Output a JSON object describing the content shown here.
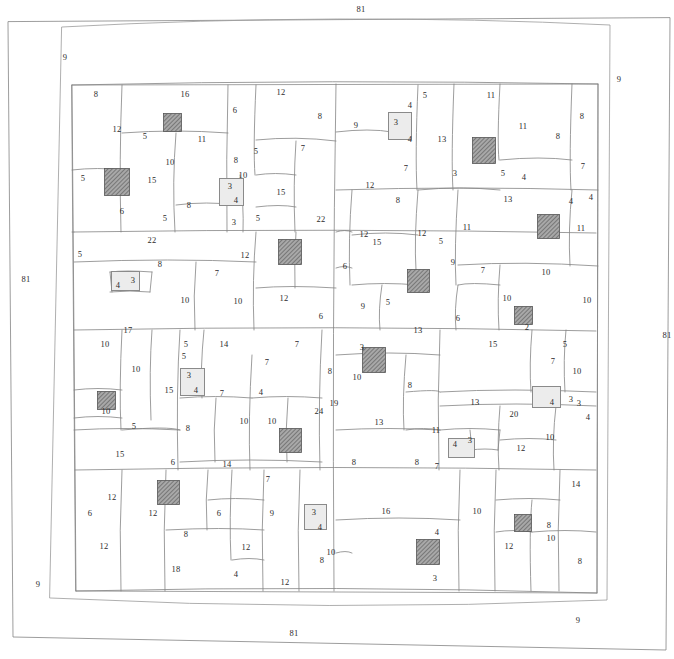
{
  "diagram": {
    "kind": "hand-drawn rectangular building plan with perimeter corridor and partitioned room grid",
    "stroke_color": "#777777",
    "text_color": "#2b2b2b",
    "background_color": "#ffffff",
    "hatch_fill_color": "#9a9a9a",
    "light_fill_color": "#ececec"
  },
  "perimeter": {
    "top_length": "81",
    "bottom_length": "81",
    "left_length": "81",
    "right_length": "81",
    "corner_top_left": "9",
    "corner_top_right": "9",
    "corner_bottom_left": "9",
    "corner_bottom_right": "9"
  },
  "shafts": [
    {
      "id": "shaft-1",
      "style": "hatch",
      "w": "3",
      "h": "3",
      "x": 117,
      "y": 182,
      "bw": 26,
      "bh": 28
    },
    {
      "id": "shaft-2",
      "style": "hatch",
      "w": "2",
      "h": "2",
      "x": 172,
      "y": 122,
      "bw": 19,
      "bh": 19
    },
    {
      "id": "shaft-3",
      "style": "hatch",
      "w": "3",
      "h": "3",
      "x": 290,
      "y": 252,
      "bw": 24,
      "bh": 26
    },
    {
      "id": "shaft-4",
      "style": "hatch",
      "w": "3",
      "h": "3",
      "x": 484,
      "y": 150,
      "bw": 24,
      "bh": 27
    },
    {
      "id": "shaft-5",
      "style": "hatch",
      "w": "3",
      "h": "3",
      "x": 548,
      "y": 226,
      "bw": 23,
      "bh": 25
    },
    {
      "id": "shaft-6",
      "style": "hatch",
      "w": "3",
      "h": "3",
      "x": 418,
      "y": 281,
      "bw": 23,
      "bh": 24
    },
    {
      "id": "shaft-7",
      "style": "hatch",
      "w": "2",
      "h": "2",
      "x": 523,
      "y": 315,
      "bw": 19,
      "bh": 19
    },
    {
      "id": "shaft-8",
      "style": "hatch",
      "w": "3",
      "h": "3",
      "x": 374,
      "y": 360,
      "bw": 24,
      "bh": 26
    },
    {
      "id": "shaft-9",
      "style": "hatch",
      "w": "2",
      "h": "2",
      "x": 106,
      "y": 400,
      "bw": 19,
      "bh": 19
    },
    {
      "id": "shaft-10",
      "style": "hatch",
      "w": "3",
      "h": "3",
      "x": 290,
      "y": 440,
      "bw": 23,
      "bh": 25
    },
    {
      "id": "shaft-11",
      "style": "hatch",
      "w": "3",
      "h": "3",
      "x": 168,
      "y": 492,
      "bw": 23,
      "bh": 25
    },
    {
      "id": "shaft-12",
      "style": "hatch",
      "w": "3",
      "h": "3",
      "x": 428,
      "y": 552,
      "bw": 24,
      "bh": 26
    },
    {
      "id": "shaft-13",
      "style": "hatch",
      "w": "2",
      "h": "2",
      "x": 523,
      "y": 523,
      "bw": 18,
      "bh": 18
    },
    {
      "id": "shaft-14",
      "style": "light",
      "w": "3",
      "h": "4",
      "x": 231,
      "y": 192,
      "bw": 25,
      "bh": 28
    },
    {
      "id": "shaft-15",
      "style": "light",
      "w": "3",
      "h": "4",
      "x": 400,
      "y": 126,
      "bw": 24,
      "bh": 28
    },
    {
      "id": "shaft-16",
      "style": "light",
      "w": "4",
      "h": "3",
      "x": 125,
      "y": 281,
      "bw": 29,
      "bh": 20
    },
    {
      "id": "shaft-17",
      "style": "light",
      "w": "3",
      "h": "4",
      "x": 192,
      "y": 382,
      "bw": 25,
      "bh": 28
    },
    {
      "id": "shaft-18",
      "style": "light",
      "w": "4",
      "h": "3",
      "x": 546,
      "y": 397,
      "bw": 29,
      "bh": 22
    },
    {
      "id": "shaft-19",
      "style": "light",
      "w": "4",
      "h": "3",
      "x": 461,
      "y": 448,
      "bw": 27,
      "bh": 20
    },
    {
      "id": "shaft-20",
      "style": "light",
      "w": "3",
      "h": "",
      "x": 315,
      "y": 517,
      "bw": 23,
      "bh": 26
    }
  ],
  "dimensions": [
    {
      "v": "81",
      "x": 361,
      "y": 9
    },
    {
      "v": "9",
      "x": 65,
      "y": 57
    },
    {
      "v": "9",
      "x": 619,
      "y": 79
    },
    {
      "v": "81",
      "x": 26,
      "y": 279
    },
    {
      "v": "81",
      "x": 667,
      "y": 335
    },
    {
      "v": "9",
      "x": 38,
      "y": 584
    },
    {
      "v": "9",
      "x": 578,
      "y": 620
    },
    {
      "v": "81",
      "x": 294,
      "y": 633
    },
    {
      "v": "8",
      "x": 96,
      "y": 94
    },
    {
      "v": "16",
      "x": 185,
      "y": 94
    },
    {
      "v": "12",
      "x": 281,
      "y": 92
    },
    {
      "v": "6",
      "x": 235,
      "y": 110
    },
    {
      "v": "8",
      "x": 320,
      "y": 116
    },
    {
      "v": "12",
      "x": 117,
      "y": 129
    },
    {
      "v": "5",
      "x": 145,
      "y": 136
    },
    {
      "v": "11",
      "x": 202,
      "y": 139
    },
    {
      "v": "9",
      "x": 356,
      "y": 125
    },
    {
      "v": "4",
      "x": 410,
      "y": 105
    },
    {
      "v": "3",
      "x": 396,
      "y": 122
    },
    {
      "v": "4",
      "x": 410,
      "y": 139
    },
    {
      "v": "5",
      "x": 425,
      "y": 95
    },
    {
      "v": "11",
      "x": 491,
      "y": 95
    },
    {
      "v": "13",
      "x": 442,
      "y": 139
    },
    {
      "v": "11",
      "x": 523,
      "y": 126
    },
    {
      "v": "8",
      "x": 558,
      "y": 136
    },
    {
      "v": "8",
      "x": 582,
      "y": 116
    },
    {
      "v": "7",
      "x": 406,
      "y": 168
    },
    {
      "v": "7",
      "x": 583,
      "y": 166
    },
    {
      "v": "3",
      "x": 455,
      "y": 173
    },
    {
      "v": "5",
      "x": 503,
      "y": 173
    },
    {
      "v": "4",
      "x": 524,
      "y": 177
    },
    {
      "v": "5",
      "x": 83,
      "y": 178
    },
    {
      "v": "10",
      "x": 170,
      "y": 162
    },
    {
      "v": "15",
      "x": 152,
      "y": 180
    },
    {
      "v": "8",
      "x": 236,
      "y": 160
    },
    {
      "v": "5",
      "x": 256,
      "y": 151
    },
    {
      "v": "7",
      "x": 303,
      "y": 148
    },
    {
      "v": "10",
      "x": 243,
      "y": 175
    },
    {
      "v": "3",
      "x": 230,
      "y": 186
    },
    {
      "v": "4",
      "x": 236,
      "y": 200
    },
    {
      "v": "15",
      "x": 281,
      "y": 192
    },
    {
      "v": "8",
      "x": 189,
      "y": 205
    },
    {
      "v": "6",
      "x": 122,
      "y": 211
    },
    {
      "v": "5",
      "x": 165,
      "y": 218
    },
    {
      "v": "3",
      "x": 234,
      "y": 222
    },
    {
      "v": "5",
      "x": 258,
      "y": 218
    },
    {
      "v": "22",
      "x": 321,
      "y": 219
    },
    {
      "v": "12",
      "x": 370,
      "y": 185
    },
    {
      "v": "8",
      "x": 398,
      "y": 200
    },
    {
      "v": "13",
      "x": 508,
      "y": 199
    },
    {
      "v": "4",
      "x": 571,
      "y": 201
    },
    {
      "v": "4",
      "x": 591,
      "y": 197
    },
    {
      "v": "12",
      "x": 364,
      "y": 234
    },
    {
      "v": "15",
      "x": 377,
      "y": 242
    },
    {
      "v": "12",
      "x": 422,
      "y": 233
    },
    {
      "v": "5",
      "x": 441,
      "y": 241
    },
    {
      "v": "11",
      "x": 467,
      "y": 227
    },
    {
      "v": "11",
      "x": 581,
      "y": 228
    },
    {
      "v": "22",
      "x": 152,
      "y": 240
    },
    {
      "v": "5",
      "x": 80,
      "y": 254
    },
    {
      "v": "8",
      "x": 160,
      "y": 264
    },
    {
      "v": "7",
      "x": 217,
      "y": 273
    },
    {
      "v": "12",
      "x": 245,
      "y": 255
    },
    {
      "v": "4",
      "x": 118,
      "y": 285
    },
    {
      "v": "3",
      "x": 133,
      "y": 280
    },
    {
      "v": "6",
      "x": 345,
      "y": 266
    },
    {
      "v": "9",
      "x": 453,
      "y": 262
    },
    {
      "v": "7",
      "x": 483,
      "y": 270
    },
    {
      "v": "10",
      "x": 546,
      "y": 272
    },
    {
      "v": "10",
      "x": 185,
      "y": 300
    },
    {
      "v": "10",
      "x": 238,
      "y": 301
    },
    {
      "v": "12",
      "x": 284,
      "y": 298
    },
    {
      "v": "5",
      "x": 388,
      "y": 302
    },
    {
      "v": "9",
      "x": 363,
      "y": 306
    },
    {
      "v": "6",
      "x": 321,
      "y": 316
    },
    {
      "v": "6",
      "x": 458,
      "y": 318
    },
    {
      "v": "10",
      "x": 507,
      "y": 298
    },
    {
      "v": "10",
      "x": 587,
      "y": 300
    },
    {
      "v": "2",
      "x": 527,
      "y": 327
    },
    {
      "v": "17",
      "x": 128,
      "y": 330
    },
    {
      "v": "13",
      "x": 418,
      "y": 330
    },
    {
      "v": "10",
      "x": 105,
      "y": 344
    },
    {
      "v": "5",
      "x": 186,
      "y": 344
    },
    {
      "v": "14",
      "x": 224,
      "y": 344
    },
    {
      "v": "7",
      "x": 297,
      "y": 344
    },
    {
      "v": "15",
      "x": 493,
      "y": 344
    },
    {
      "v": "5",
      "x": 565,
      "y": 344
    },
    {
      "v": "3",
      "x": 362,
      "y": 347
    },
    {
      "v": "5",
      "x": 184,
      "y": 356
    },
    {
      "v": "7",
      "x": 267,
      "y": 362
    },
    {
      "v": "7",
      "x": 553,
      "y": 361
    },
    {
      "v": "10",
      "x": 136,
      "y": 369
    },
    {
      "v": "10",
      "x": 577,
      "y": 371
    },
    {
      "v": "3",
      "x": 189,
      "y": 375
    },
    {
      "v": "4",
      "x": 196,
      "y": 390
    },
    {
      "v": "15",
      "x": 169,
      "y": 390
    },
    {
      "v": "7",
      "x": 222,
      "y": 393
    },
    {
      "v": "4",
      "x": 261,
      "y": 392
    },
    {
      "v": "8",
      "x": 410,
      "y": 385
    },
    {
      "v": "8",
      "x": 330,
      "y": 371
    },
    {
      "v": "10",
      "x": 357,
      "y": 377
    },
    {
      "v": "19",
      "x": 334,
      "y": 403
    },
    {
      "v": "24",
      "x": 319,
      "y": 411
    },
    {
      "v": "10",
      "x": 244,
      "y": 421
    },
    {
      "v": "10",
      "x": 272,
      "y": 421
    },
    {
      "v": "10",
      "x": 106,
      "y": 411
    },
    {
      "v": "13",
      "x": 379,
      "y": 422
    },
    {
      "v": "13",
      "x": 475,
      "y": 402
    },
    {
      "v": "20",
      "x": 514,
      "y": 414
    },
    {
      "v": "4",
      "x": 552,
      "y": 402
    },
    {
      "v": "3",
      "x": 571,
      "y": 399
    },
    {
      "v": "3",
      "x": 579,
      "y": 403
    },
    {
      "v": "4",
      "x": 588,
      "y": 417
    },
    {
      "v": "5",
      "x": 134,
      "y": 426
    },
    {
      "v": "8",
      "x": 188,
      "y": 428
    },
    {
      "v": "11",
      "x": 436,
      "y": 430
    },
    {
      "v": "10",
      "x": 550,
      "y": 437
    },
    {
      "v": "4",
      "x": 455,
      "y": 444
    },
    {
      "v": "3",
      "x": 470,
      "y": 440
    },
    {
      "v": "15",
      "x": 120,
      "y": 454
    },
    {
      "v": "14",
      "x": 227,
      "y": 464
    },
    {
      "v": "6",
      "x": 173,
      "y": 462
    },
    {
      "v": "8",
      "x": 354,
      "y": 462
    },
    {
      "v": "8",
      "x": 417,
      "y": 462
    },
    {
      "v": "7",
      "x": 437,
      "y": 466
    },
    {
      "v": "12",
      "x": 521,
      "y": 448
    },
    {
      "v": "14",
      "x": 576,
      "y": 484
    },
    {
      "v": "7",
      "x": 268,
      "y": 479
    },
    {
      "v": "12",
      "x": 112,
      "y": 497
    },
    {
      "v": "12",
      "x": 153,
      "y": 513
    },
    {
      "v": "6",
      "x": 90,
      "y": 513
    },
    {
      "v": "6",
      "x": 219,
      "y": 513
    },
    {
      "v": "9",
      "x": 272,
      "y": 513
    },
    {
      "v": "16",
      "x": 386,
      "y": 511
    },
    {
      "v": "10",
      "x": 477,
      "y": 511
    },
    {
      "v": "3",
      "x": 314,
      "y": 512
    },
    {
      "v": "4",
      "x": 320,
      "y": 527
    },
    {
      "v": "8",
      "x": 549,
      "y": 525
    },
    {
      "v": "8",
      "x": 186,
      "y": 534
    },
    {
      "v": "12",
      "x": 104,
      "y": 546
    },
    {
      "v": "12",
      "x": 246,
      "y": 547
    },
    {
      "v": "10",
      "x": 331,
      "y": 552
    },
    {
      "v": "10",
      "x": 551,
      "y": 538
    },
    {
      "v": "12",
      "x": 509,
      "y": 546
    },
    {
      "v": "4",
      "x": 437,
      "y": 532
    },
    {
      "v": "18",
      "x": 176,
      "y": 569
    },
    {
      "v": "4",
      "x": 236,
      "y": 574
    },
    {
      "v": "12",
      "x": 285,
      "y": 582
    },
    {
      "v": "8",
      "x": 580,
      "y": 561
    },
    {
      "v": "3",
      "x": 435,
      "y": 578
    },
    {
      "v": "8",
      "x": 322,
      "y": 560
    }
  ]
}
